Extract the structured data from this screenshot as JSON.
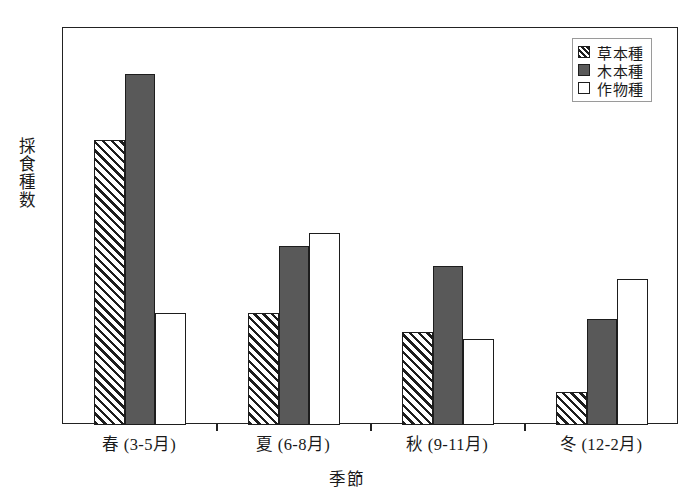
{
  "chart_data": {
    "type": "bar",
    "title": "",
    "xlabel": "季節",
    "ylabel": "採食種数",
    "ylim": [
      0,
      60
    ],
    "yticks": [
      0,
      10,
      20,
      30,
      40,
      50,
      60
    ],
    "ytick_labels": [
      "0",
      "10",
      "20",
      "30",
      "40",
      "50",
      "60"
    ],
    "grid": false,
    "legend_position": "top-right",
    "categories": [
      "春 (3-5月)",
      "夏 (6-8月)",
      "秋 (9-11月)",
      "冬 (12-2月)"
    ],
    "series": [
      {
        "name": "草本種",
        "pattern": "diagonal-hatch",
        "color": "#ffffff",
        "values": [
          43,
          17,
          14,
          5
        ]
      },
      {
        "name": "木本種",
        "pattern": "solid-dark",
        "color": "#595959",
        "values": [
          53,
          27,
          24,
          16
        ]
      },
      {
        "name": "作物種",
        "pattern": "solid-white",
        "color": "#ffffff",
        "values": [
          17,
          29,
          13,
          22
        ]
      }
    ]
  },
  "colors": {
    "bar_dark": "#595959",
    "bar_white": "#ffffff",
    "outline": "#1d1d1d",
    "axis": "#222222",
    "background": "#ffffff"
  }
}
